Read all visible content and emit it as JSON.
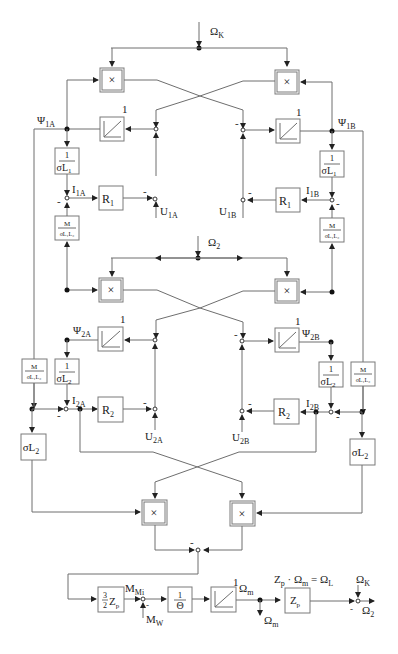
{
  "diagram": {
    "title": "",
    "inputs": {
      "omega_k_top": "Ω",
      "omega_k_top_sub": "K",
      "omega_2_mid": "Ω",
      "omega_2_mid_sub": "2"
    },
    "signals": {
      "psi_1a": "Ψ",
      "psi_1a_sub": "1A",
      "psi_1b": "Ψ",
      "psi_1b_sub": "1B",
      "psi_2a": "Ψ",
      "psi_2a_sub": "2A",
      "psi_2b": "Ψ",
      "psi_2b_sub": "2B",
      "i_1a": "I",
      "i_1a_sub": "1A",
      "i_1b": "I",
      "i_1b_sub": "1B",
      "i_2a": "I",
      "i_2a_sub": "2A",
      "i_2b": "I",
      "i_2b_sub": "2B",
      "u_1a": "U",
      "u_1a_sub": "1A",
      "u_1b": "U",
      "u_1b_sub": "1B",
      "u_2a": "U",
      "u_2a_sub": "2A",
      "u_2b": "U",
      "u_2b_sub": "2B",
      "m_mi": "M",
      "m_mi_sub": "Mi",
      "m_w": "M",
      "m_w_sub": "W",
      "omega_m": "Ω",
      "omega_m_sub": "m",
      "omega_m_out": "Ω",
      "omega_m_out_sub": "m",
      "omega_k_bottom": "Ω",
      "omega_k_bottom_sub": "K",
      "omega_2_out": "Ω",
      "omega_2_out_sub": "2",
      "equation": "Z",
      "equation_sub1": "p",
      "equation_mid": " · Ω",
      "equation_sub2": "m",
      "equation_mid2": " = Ω",
      "equation_sub3": "L"
    },
    "blocks": {
      "multiplier_symbol": "×",
      "integrator_gain": "1",
      "r1": "R",
      "r1_sub": "1",
      "r2": "R",
      "r2_sub": "2",
      "inv_sigma_l1_num": "1",
      "inv_sigma_l1_den": "σL",
      "inv_sigma_l1_den_sub": "1",
      "inv_sigma_l2_num": "1",
      "inv_sigma_l2_den": "σL",
      "inv_sigma_l2_den_sub": "2",
      "m_ratio_num": "M",
      "m_ratio_den": "σL₁L₂",
      "sigma_l2": "σL",
      "sigma_l2_sub": "2",
      "torque_gain_num": "3",
      "torque_gain_den": "2",
      "torque_gain_z": "Z",
      "torque_gain_z_sub": "p",
      "inertia_num": "1",
      "inertia_den": "Θ",
      "zp": "Z",
      "zp_sub": "p"
    },
    "sum_sign": "-"
  }
}
